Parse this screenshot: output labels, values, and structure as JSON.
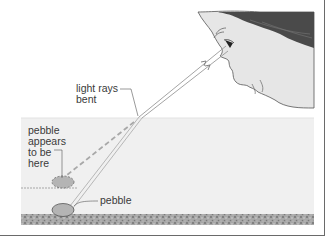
{
  "diagram": {
    "topic": "refraction of light in water",
    "labels": {
      "light_rays_bent_line1": "light rays",
      "light_rays_bent_line2": "bent",
      "apparent_line1": "pebble",
      "apparent_line2": "appears",
      "apparent_line3": "to be",
      "apparent_line4": "here",
      "pebble": "pebble"
    },
    "elements": [
      "face-observer",
      "eye",
      "light-rays",
      "water",
      "water-surface",
      "apparent-pebble",
      "real-pebble",
      "gravel-bed"
    ],
    "colors": {
      "water": "#f0f0f0",
      "hair": "#4a4a4a",
      "skin": "#e6e6e6",
      "pebble": "#b4b4b4",
      "gravel": "#9a9a9a",
      "line": "#555555",
      "frame": "#6a6a6a"
    }
  }
}
